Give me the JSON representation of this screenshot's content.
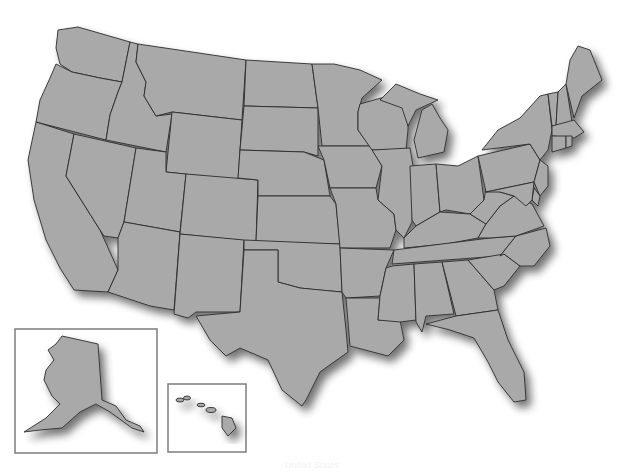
{
  "map": {
    "title": "United States",
    "fill_color": "#a9a9a9",
    "border_color": "#2b2b2b",
    "background_color": "#ffffff",
    "inset_border_color": "#7d7d7d",
    "insets": [
      {
        "name": "Alaska"
      },
      {
        "name": "Hawaii"
      }
    ],
    "regions": [
      "Washington",
      "Oregon",
      "California",
      "Idaho",
      "Nevada",
      "Montana",
      "Wyoming",
      "Utah",
      "Arizona",
      "Colorado",
      "New Mexico",
      "North Dakota",
      "South Dakota",
      "Nebraska",
      "Kansas",
      "Oklahoma",
      "Texas",
      "Minnesota",
      "Iowa",
      "Missouri",
      "Arkansas",
      "Louisiana",
      "Wisconsin",
      "Illinois",
      "Michigan",
      "Indiana",
      "Ohio",
      "Kentucky",
      "Tennessee",
      "Mississippi",
      "Alabama",
      "Georgia",
      "Florida",
      "South Carolina",
      "North Carolina",
      "Virginia",
      "West Virginia",
      "Pennsylvania",
      "New York",
      "Maryland",
      "Delaware",
      "New Jersey",
      "Connecticut",
      "Rhode Island",
      "Massachusetts",
      "Vermont",
      "New Hampshire",
      "Maine",
      "Alaska",
      "Hawaii"
    ]
  }
}
